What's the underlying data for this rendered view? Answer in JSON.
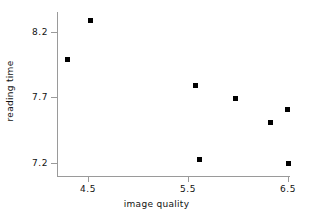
{
  "chart_data": {
    "type": "scatter",
    "title": "",
    "xlabel": "image quality",
    "ylabel": "reading time",
    "xticks": [
      "4.5",
      "5.5",
      "6.5"
    ],
    "xtick_values": [
      4.5,
      5.5,
      6.5
    ],
    "yticks": [
      "8.2",
      "7.7",
      "7.2"
    ],
    "ytick_values": [
      8.2,
      7.7,
      7.2
    ],
    "xlim": [
      4.2,
      6.53
    ],
    "ylim": [
      7.16,
      8.33
    ],
    "grid": false,
    "legend": false,
    "marker": "filled-square",
    "marker_color": "#000000",
    "points": [
      {
        "x": 4.29,
        "y": 7.99
      },
      {
        "x": 4.52,
        "y": 8.29
      },
      {
        "x": 5.57,
        "y": 7.79
      },
      {
        "x": 5.61,
        "y": 7.23
      },
      {
        "x": 5.97,
        "y": 7.69
      },
      {
        "x": 6.32,
        "y": 7.51
      },
      {
        "x": 6.49,
        "y": 7.61
      },
      {
        "x": 6.5,
        "y": 7.2
      }
    ]
  },
  "axes": {
    "x_title": "image quality",
    "y_title": "reading time",
    "x_tick_labels": [
      "4.5",
      "5.5",
      "6.5"
    ],
    "y_tick_labels": [
      "8.2",
      "7.7",
      "7.2"
    ],
    "axis_color": "#9a9a9a",
    "text_color": "#111111"
  }
}
